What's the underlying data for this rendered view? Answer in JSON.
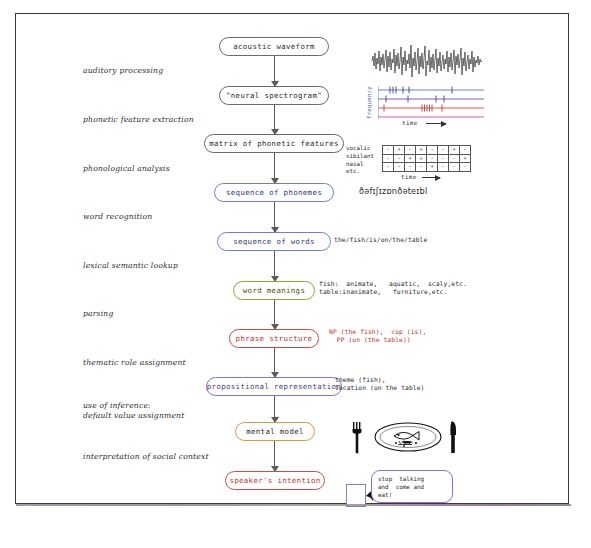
{
  "nodes": [
    {
      "id": "acoustic-waveform",
      "label": "acoustic waveform",
      "color": "gray",
      "x": 218,
      "y": 36,
      "w": 110
    },
    {
      "id": "neural-spectrogram",
      "label": "\"neural spectrogram\"",
      "color": "gray",
      "x": 218,
      "y": 85,
      "w": 110
    },
    {
      "id": "matrix-phonetic-features",
      "label": "matrix of phonetic features",
      "color": "gray",
      "x": 203,
      "y": 133,
      "w": 140
    },
    {
      "id": "sequence-of-phonemes",
      "label": "sequence of phonemes",
      "color": "blue",
      "x": 213,
      "y": 182,
      "w": 120
    },
    {
      "id": "sequence-of-words",
      "label": "sequence of words",
      "color": "blue",
      "x": 216,
      "y": 231,
      "w": 114
    },
    {
      "id": "word-meanings",
      "label": "word meanings",
      "color": "olive",
      "x": 232,
      "y": 280,
      "w": 82
    },
    {
      "id": "phrase-structure",
      "label": "phrase structure",
      "color": "red",
      "x": 228,
      "y": 328,
      "w": 90
    },
    {
      "id": "propositional-representation",
      "label": "propositional representation",
      "color": "purple",
      "x": 205,
      "y": 376,
      "w": 136
    },
    {
      "id": "mental-model",
      "label": "mental model",
      "color": "orange",
      "x": 234,
      "y": 421,
      "w": 80
    },
    {
      "id": "speaker-intention",
      "label": "speaker's intention",
      "color": "crimson",
      "x": 224,
      "y": 470,
      "w": 100
    }
  ],
  "stages": [
    {
      "id": "auditory-processing",
      "label": "auditory processing",
      "x": 82,
      "y": 65
    },
    {
      "id": "phonetic-feature-extraction",
      "label": "phonetic feature extraction",
      "x": 82,
      "y": 114
    },
    {
      "id": "phonological-analysis",
      "label": "phonological analysis",
      "x": 82,
      "y": 163
    },
    {
      "id": "word-recognition",
      "label": "word recognition",
      "x": 82,
      "y": 211
    },
    {
      "id": "lexical-semantic-lookup",
      "label": "lexical semantic lookup",
      "x": 82,
      "y": 260
    },
    {
      "id": "parsing",
      "label": "parsing",
      "x": 82,
      "y": 308
    },
    {
      "id": "thematic-role-assignment",
      "label": "thematic role assignment",
      "x": 82,
      "y": 357
    },
    {
      "id": "use-of-inference",
      "label": "use of inference:\ndefault value assignment",
      "x": 82,
      "y": 400
    },
    {
      "id": "interpretation-social-context",
      "label": "interpretation of social context",
      "x": 82,
      "y": 451
    }
  ],
  "annotations": {
    "phonemes": {
      "text": "ðəfɪʃɪzɒnðəteɪbl",
      "x": 358,
      "y": 186
    },
    "words": {
      "text": "the/fish/is/on/the/table",
      "x": 333,
      "y": 235
    },
    "word_meanings": {
      "text": "fish:  animate,   aquatic,  scaly,etc.\ntable:inanimate,   furniture,etc.",
      "x": 318,
      "y": 279
    },
    "phrase_structure": {
      "text": "NP (the fish),  cop (is),\n  PP (on (the table))",
      "x": 328,
      "y": 327
    },
    "thematic_roles": {
      "text": "theme (fish),\nlocation (on the table)",
      "x": 334,
      "y": 375
    }
  },
  "waveform": {
    "name": "acoustic-waveform-plot",
    "description": "dense noisy speech waveform"
  },
  "spectrogram": {
    "name": "neural-spectrogram-plot",
    "ylabel": "frequency",
    "xlabel": "time",
    "bands": [
      {
        "color": "#5b6fd6",
        "ticks": [
          12,
          16,
          20,
          28,
          33,
          74
        ]
      },
      {
        "color": "#6b4fb0",
        "ticks": [
          8,
          30,
          58,
          66
        ]
      },
      {
        "color": "#d8483f",
        "ticks": [
          6,
          44,
          47,
          50,
          53,
          56,
          64
        ]
      },
      {
        "color": "#c94fa8",
        "ticks": []
      }
    ]
  },
  "feature_matrix": {
    "name": "phonetic-feature-matrix",
    "row_labels": [
      "vocalic",
      "sibilant",
      "nasal",
      "etc."
    ],
    "xlabel": "time",
    "columns": 8,
    "rows": [
      [
        "-",
        "+",
        "-",
        "+",
        "-",
        "-",
        "+",
        "-"
      ],
      [
        "-",
        "-",
        "+",
        "+",
        "-",
        "-",
        "-",
        "+"
      ],
      [
        "-",
        "-",
        "-",
        "-",
        "+",
        "-",
        "-",
        "-"
      ]
    ]
  },
  "place_setting": {
    "name": "place-setting-illustration",
    "items": [
      "fork",
      "plate-with-fish",
      "knife"
    ]
  },
  "speech_bubble": {
    "name": "speech-bubble",
    "text": "stop  talking\nand  come and\neat!"
  },
  "colors": {
    "gray": "#6a6a6a",
    "blue": "#6f7fd0",
    "olive": "#9aa03a",
    "red": "#cf4b42",
    "purple": "#8b6fcf",
    "orange": "#d79a3c",
    "crimson": "#c0504d",
    "arrow": "#5a5a5a",
    "frame": "#3a3a3a"
  }
}
